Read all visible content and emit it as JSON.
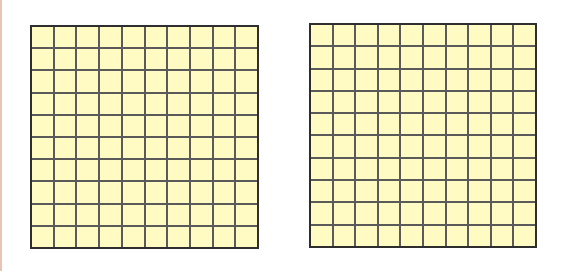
{
  "figure": {
    "background": "#ffffff",
    "grids": [
      {
        "id": "left",
        "rows": 10,
        "cols": 10,
        "shaded_cells": 0,
        "cell_color": "#fffbc2",
        "line_color": "#5a5a5a",
        "border_color": "#2e2e2e",
        "x": 30,
        "y": 25,
        "width": 229,
        "height": 224
      },
      {
        "id": "right",
        "rows": 10,
        "cols": 10,
        "shaded_cells": 0,
        "cell_color": "#fffbc2",
        "line_color": "#5a5a5a",
        "border_color": "#2e2e2e",
        "x": 309,
        "y": 23,
        "width": 228,
        "height": 225
      }
    ]
  }
}
